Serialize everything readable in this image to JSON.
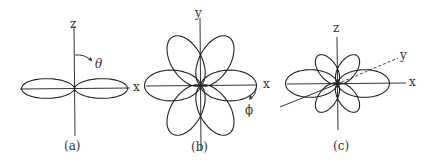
{
  "panels": [
    {
      "caption": "(a)",
      "axes": {
        "vertical": "z",
        "horizontal": "x"
      },
      "angle_label": "θ",
      "lobe_count": 2,
      "lobe_directions_deg": [
        0,
        180
      ]
    },
    {
      "caption": "(b)",
      "axes": {
        "vertical": "y",
        "horizontal": "x"
      },
      "angle_label": "ϕ",
      "lobe_count": 6,
      "lobe_directions_deg": [
        0,
        60,
        120,
        180,
        240,
        300
      ]
    },
    {
      "caption": "(c)",
      "axes": {
        "vertical": "z",
        "horizontal": "x",
        "depth": "y"
      },
      "lobe_count": 6,
      "lobe_directions_deg": [
        0,
        55,
        125,
        180,
        235,
        305
      ]
    }
  ],
  "colors": {
    "line": "#222222",
    "background": "#ffffff"
  }
}
